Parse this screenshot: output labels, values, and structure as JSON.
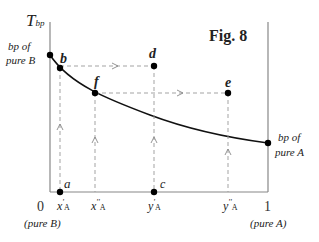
{
  "figure": {
    "title": "Fig. 8",
    "y_axis_label": "T",
    "y_axis_sub": "bp",
    "left_label_line1": "bp of",
    "left_label_line2": "pure B",
    "right_label_line1": "bp of",
    "right_label_line2": "pure A",
    "x_tick_left": "0",
    "x_tick_right": "1",
    "x_left_caption": "(pure B)",
    "x_right_caption": "(pure A)",
    "points": {
      "a": "a",
      "b": "b",
      "c": "c",
      "d": "d",
      "e": "e",
      "f": "f"
    },
    "x_ticks": [
      {
        "sym": "x",
        "prime": "'",
        "sub": "A"
      },
      {
        "sym": "x",
        "prime": "''",
        "sub": "A"
      },
      {
        "sym": "y",
        "prime": "'",
        "sub": "A"
      },
      {
        "sym": "y",
        "prime": "''",
        "sub": "A"
      }
    ],
    "colors": {
      "axis": "#888888",
      "curve": "#111111",
      "dashed": "#999999",
      "point": "#000000"
    }
  }
}
